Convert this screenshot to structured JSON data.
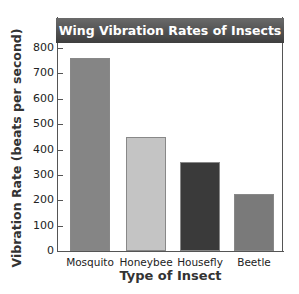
{
  "chart_data": {
    "type": "bar",
    "title": "Wing Vibration Rates of Insects",
    "xlabel": "Type of Insect",
    "ylabel": "Vibration Rate (beats per second)",
    "categories": [
      "Mosquito",
      "Honeybee",
      "Housefly",
      "Beetle"
    ],
    "values": [
      760,
      450,
      350,
      225
    ],
    "ylim": [
      0,
      800
    ],
    "yticks": [
      0,
      100,
      200,
      300,
      400,
      500,
      600,
      700,
      800
    ],
    "grid": false,
    "legend": null,
    "bar_colors": [
      "#858585",
      "#c4c4c4",
      "#3a3a3a",
      "#7a7a7a"
    ],
    "title_bar_color": "#4a4a4a"
  }
}
